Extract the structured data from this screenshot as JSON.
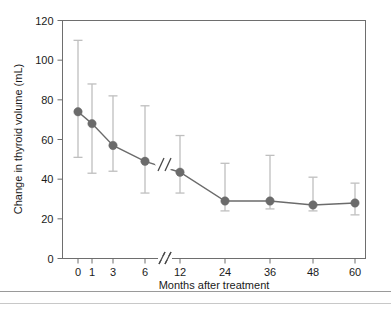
{
  "chart_data": {
    "type": "line",
    "title": "",
    "subtitle": "",
    "xlabel": "Months after treatment",
    "ylabel": "Change in thyroid volume (mL)",
    "categories": [
      "0",
      "1",
      "3",
      "6",
      "12",
      "24",
      "36",
      "48",
      "60"
    ],
    "x_tick_labels": [
      "0",
      "1",
      "3",
      "6",
      "12",
      "24",
      "36",
      "48",
      "60"
    ],
    "y_tick_labels": [
      "0",
      "20",
      "40",
      "60",
      "80",
      "100",
      "120"
    ],
    "y_ticks": [
      0,
      20,
      40,
      60,
      80,
      100,
      120
    ],
    "ylim": [
      0,
      120
    ],
    "grid": false,
    "legend": "none",
    "axis_break": "//",
    "axis_break_between": [
      "6",
      "12"
    ],
    "series": [
      {
        "name": "Change in thyroid volume",
        "values": [
          74,
          68,
          57,
          49,
          43.5,
          29,
          29,
          27,
          28
        ],
        "error_low": [
          51,
          43,
          44,
          33,
          33,
          24,
          25,
          24,
          22
        ],
        "error_high": [
          110,
          88,
          82,
          77,
          62,
          48,
          52,
          41,
          38
        ],
        "marker": "circle",
        "color": "#6b6b6b"
      }
    ],
    "annotations": []
  },
  "colors": {
    "marker": "#6b6b6b",
    "line": "#6b6b6b",
    "errorbar": "#bfbfbf",
    "axis": "#6e6e6e",
    "text": "#1a1a1a",
    "background": "#ffffff",
    "footer_rule": "#9a9a9a"
  }
}
